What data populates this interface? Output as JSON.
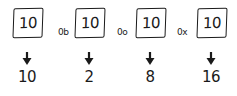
{
  "columns": [
    {
      "prefix": "",
      "box_value": "10",
      "result": "10",
      "base": "decimal"
    },
    {
      "prefix": "0b",
      "box_value": "10",
      "result": "2",
      "base": "binary"
    },
    {
      "prefix": "0o",
      "box_value": "10",
      "result": "8",
      "base": "octal"
    },
    {
      "prefix": "0x",
      "box_value": "10",
      "result": "16",
      "base": "hexadecimal"
    }
  ],
  "colors": {
    "ink": "#1a1a1a",
    "background": "#ffffff"
  }
}
